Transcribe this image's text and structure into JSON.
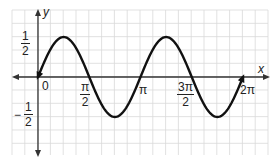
{
  "chart_data": {
    "type": "line",
    "title": "",
    "function": "y = (1/2) sin(2x)",
    "xlabel": "x",
    "ylabel": "y",
    "xlim": [
      0,
      6.2832
    ],
    "ylim": [
      -0.5,
      0.5
    ],
    "grid": true,
    "legend": null,
    "x_ticks": [
      {
        "value": 0,
        "label": "0"
      },
      {
        "value": 1.5708,
        "label": "π/2"
      },
      {
        "value": 3.1416,
        "label": "π"
      },
      {
        "value": 4.7124,
        "label": "3π/2"
      },
      {
        "value": 6.2832,
        "label": "2π"
      }
    ],
    "y_ticks": [
      {
        "value": 0.5,
        "label": "1/2"
      },
      {
        "value": -0.5,
        "label": "-1/2"
      }
    ],
    "series": [
      {
        "name": "curve",
        "x": [
          0,
          0.7854,
          1.5708,
          2.3562,
          3.1416,
          3.927,
          4.7124,
          5.4978,
          6.2832
        ],
        "values": [
          0,
          0.5,
          0,
          -0.5,
          0,
          0.5,
          0,
          -0.5,
          0
        ],
        "color": "#111111",
        "arrows": "both ends"
      }
    ],
    "key_points": {
      "maxima": [
        [
          0.7854,
          0.5
        ],
        [
          3.927,
          0.5
        ]
      ],
      "minima": [
        [
          2.3562,
          -0.5
        ],
        [
          5.4978,
          -0.5
        ]
      ],
      "zeros": [
        0,
        1.5708,
        3.1416,
        4.7124,
        6.2832
      ]
    }
  },
  "labels": {
    "y_axis": "y",
    "x_axis": "x",
    "origin": "0",
    "half_num": "1",
    "half_den": "2",
    "neg_sign": "−",
    "neg_half_num": "1",
    "neg_half_den": "2",
    "pi_half_num": "π",
    "pi_half_den": "2",
    "pi": "π",
    "three_pi_half_num": "3π",
    "three_pi_half_den": "2",
    "two_pi": "2π"
  },
  "colors": {
    "grid": "#d9d9d9",
    "axis": "#333333",
    "curve": "#111111",
    "text": "#222222"
  }
}
